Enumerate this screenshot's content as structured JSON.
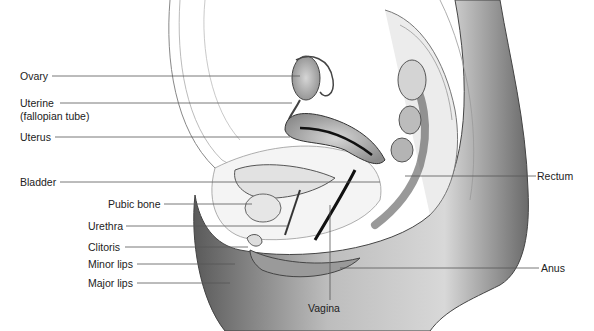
{
  "diagram": {
    "labels_left": [
      {
        "id": "ovary",
        "text": "Ovary",
        "x": 20,
        "y": 70,
        "line_to": [
          415,
          76
        ]
      },
      {
        "id": "uterine-tube",
        "text": "Uterine",
        "x": 20,
        "y": 96,
        "line_to": [
          290,
          103
        ]
      },
      {
        "id": "uterine-tube-sub",
        "text": "(fallopian tube)",
        "x": 20,
        "y": 108
      },
      {
        "id": "uterus",
        "text": "Uterus",
        "x": 20,
        "y": 131,
        "line_to": [
          283,
          137
        ]
      },
      {
        "id": "bladder",
        "text": "Bladder",
        "x": 20,
        "y": 176,
        "line_to": [
          380,
          182
        ]
      },
      {
        "id": "pubic-bone",
        "text": "Pubic bone",
        "x": 108,
        "y": 198,
        "line_to": [
          250,
          204
        ]
      },
      {
        "id": "urethra",
        "text": "Urethra",
        "x": 88,
        "y": 220,
        "line_to": [
          285,
          226
        ]
      },
      {
        "id": "clitoris",
        "text": "Clitoris",
        "x": 88,
        "y": 241,
        "line_to": [
          245,
          247
        ]
      },
      {
        "id": "minor-lips",
        "text": "Minor lips",
        "x": 88,
        "y": 258,
        "line_to": [
          252,
          264
        ]
      },
      {
        "id": "major-lips",
        "text": "Major lips",
        "x": 88,
        "y": 277,
        "line_to": [
          265,
          283
        ]
      }
    ],
    "labels_right": [
      {
        "id": "rectum",
        "text": "Rectum",
        "x": 537,
        "y": 170,
        "line_from": [
          405,
          176
        ]
      },
      {
        "id": "anus",
        "text": "Anus",
        "x": 541,
        "y": 262,
        "line_from": [
          340,
          268
        ]
      }
    ],
    "labels_bottom": [
      {
        "id": "vagina",
        "text": "Vagina",
        "x": 308,
        "y": 302,
        "line_from": [
          330,
          205
        ]
      }
    ]
  }
}
